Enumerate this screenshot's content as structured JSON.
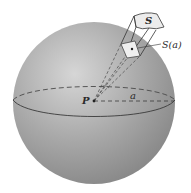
{
  "diagram": {
    "type": "sphere-solid-angle",
    "labels": {
      "center": "P",
      "radius": "a",
      "surface": "S",
      "projection": "S(a)"
    },
    "colors": {
      "sphere_light": "#d8d8d8",
      "sphere_mid": "#a9a9a9",
      "sphere_dark": "#7d7d7d",
      "patch": "#ececec",
      "line": "#3a3a3a",
      "background": "#ffffff"
    }
  }
}
